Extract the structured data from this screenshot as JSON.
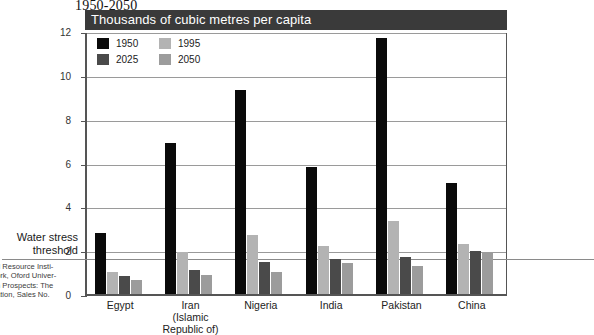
{
  "doc_title": "1950-2050",
  "banner": {
    "text": "Thousands of cubic metres per capita"
  },
  "annotation": {
    "threshold_label_line1": "Water stress",
    "threshold_label_line2": "threshold",
    "threshold_value": 1.7
  },
  "footnote": {
    "line1": "d Resource Insti-",
    "line2": "ork, Oford Univer-",
    "line3": "n Prospects: The",
    "line4": "ation, Sales No."
  },
  "colors": {
    "series_1950": "#0a0a0a",
    "series_1995": "#b3b3b3",
    "series_2025": "#4a4a4a",
    "series_2050": "#9c9c9c",
    "banner_bg": "#3a3a3a",
    "banner_text": "#ffffff",
    "axis": "#555555",
    "gridline": "#9a9a9a"
  },
  "chart_data": {
    "type": "bar",
    "title": "Thousands of cubic metres per capita",
    "xlabel": "",
    "ylabel": "Thousands of cubic metres per capita",
    "ylim": [
      0,
      12
    ],
    "yticks": [
      0,
      2,
      4,
      6,
      8,
      10,
      12
    ],
    "ytick_labels": [
      "0",
      "2",
      "4",
      "6",
      "8",
      "10",
      "12"
    ],
    "grid": true,
    "legend_position": "top-left inside plot",
    "categories": [
      "Egypt",
      "Iran\n(Islamic Republic of)",
      "Nigeria",
      "India",
      "Pakistan",
      "China"
    ],
    "category_labels": [
      {
        "line1": "Egypt",
        "line2": ""
      },
      {
        "line1": "Iran",
        "line2": "(Islamic Republic of)"
      },
      {
        "line1": "Nigeria",
        "line2": ""
      },
      {
        "line1": "India",
        "line2": ""
      },
      {
        "line1": "Pakistan",
        "line2": ""
      },
      {
        "line1": "China",
        "line2": ""
      }
    ],
    "series": [
      {
        "name": "1950",
        "color": "#0a0a0a",
        "values": [
          2.8,
          6.9,
          9.3,
          5.8,
          11.7,
          5.05
        ]
      },
      {
        "name": "1995",
        "color": "#b3b3b3",
        "values": [
          1.0,
          1.9,
          2.7,
          2.2,
          3.35,
          2.3
        ]
      },
      {
        "name": "2025",
        "color": "#4a4a4a",
        "values": [
          0.8,
          1.1,
          1.45,
          1.6,
          1.7,
          1.95
        ]
      },
      {
        "name": "2050",
        "color": "#9c9c9c",
        "values": [
          0.65,
          0.85,
          1.0,
          1.4,
          1.3,
          1.9
        ]
      }
    ],
    "annotations": [
      {
        "label": "Water stress threshold",
        "type": "hline",
        "value": 1.7
      }
    ]
  }
}
